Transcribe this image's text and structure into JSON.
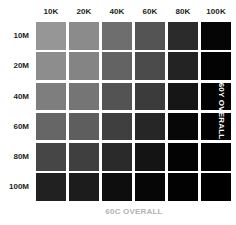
{
  "chart_data": {
    "type": "heatmap",
    "title": "",
    "xlabel": "60C OVERALL",
    "ylabel": "60Y OVERALL",
    "categories": [
      "10K",
      "20K",
      "40K",
      "60K",
      "80K",
      "100K"
    ],
    "row_categories": [
      "10M",
      "20M",
      "40M",
      "60M",
      "80M",
      "100M"
    ],
    "legend": [],
    "grid": false,
    "values": [
      [
        14,
        20,
        30,
        38,
        48,
        58
      ],
      [
        18,
        24,
        34,
        42,
        52,
        62
      ],
      [
        24,
        30,
        40,
        48,
        58,
        68
      ],
      [
        32,
        38,
        48,
        56,
        66,
        76
      ],
      [
        42,
        48,
        58,
        66,
        76,
        86
      ],
      [
        54,
        60,
        70,
        78,
        88,
        98
      ]
    ],
    "cell_colors": [
      [
        "#969696",
        "#8b8b8b",
        "#6e6e6e",
        "#545454",
        "#2b2b2b",
        "#050505"
      ],
      [
        "#8d8d8d",
        "#848484",
        "#636363",
        "#4b4b4b",
        "#232323",
        "#030303"
      ],
      [
        "#7e7e7e",
        "#757575",
        "#535353",
        "#3b3b3b",
        "#161616",
        "#020202"
      ],
      [
        "#666666",
        "#5e5e5e",
        "#3f3f3f",
        "#262626",
        "#070707",
        "#010101"
      ],
      [
        "#464646",
        "#3f3f3f",
        "#2a2a2a",
        "#141414",
        "#030303",
        "#010101"
      ],
      [
        "#212121",
        "#1c1c1c",
        "#0e0e0e",
        "#060606",
        "#020202",
        "#000000"
      ]
    ],
    "colors": {
      "background": "#ffffff",
      "label_text": "#231f20",
      "bottom_caption_text": "#b3b3b3",
      "right_caption_text": "#fbfbfb"
    }
  },
  "captions": {
    "bottom": "60C OVERALL",
    "right": "60Y OVERALL"
  }
}
